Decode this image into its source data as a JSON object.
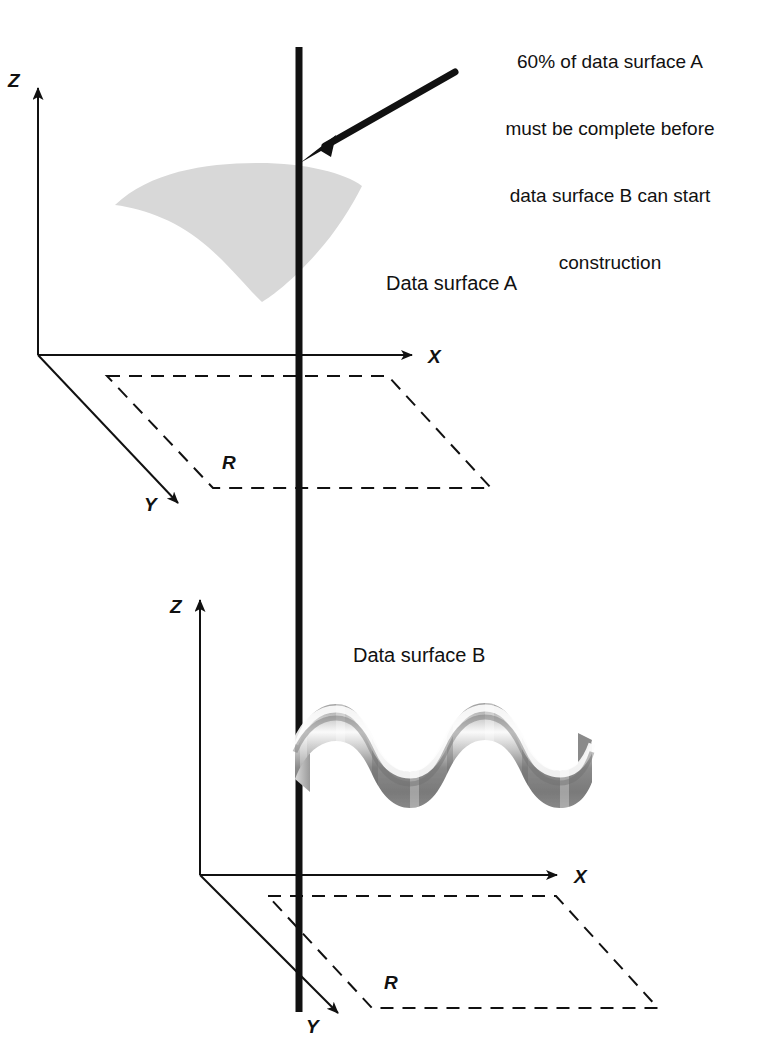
{
  "figure": {
    "type": "technical-diagram",
    "background": "#ffffff",
    "ink": "#111111",
    "surface_a_fill": "#d8d8d8",
    "surface_b_dark": "#6f6f6f",
    "surface_b_light": "#f2f2f2"
  },
  "callout": {
    "text": "60% of data surface A\nmust be complete before\ndata surface B can start\nconstruction",
    "lines": [
      "60% of data surface A",
      "must be complete before",
      "data surface B can start",
      "construction"
    ]
  },
  "top_system": {
    "axis_z": "Z",
    "axis_x": "X",
    "axis_y": "Y",
    "region_label": "R",
    "surface_label": "Data surface A"
  },
  "bottom_system": {
    "axis_z": "Z",
    "axis_x": "X",
    "axis_y": "Y",
    "region_label": "R",
    "surface_label": "Data surface B"
  },
  "caption": {
    "text": ""
  }
}
